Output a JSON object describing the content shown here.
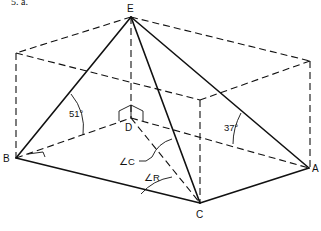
{
  "problem_label": "5.  a.",
  "points": {
    "E": {
      "label": "E"
    },
    "B": {
      "label": "B"
    },
    "D": {
      "label": "D"
    },
    "A": {
      "label": "A"
    },
    "C": {
      "label": "C"
    }
  },
  "angles": {
    "left_face": "51°",
    "right_face": "37°",
    "angle_c": "∠C",
    "angle_r": "∠R"
  },
  "colors": {
    "ink": "#111111",
    "background": "#ffffff"
  }
}
